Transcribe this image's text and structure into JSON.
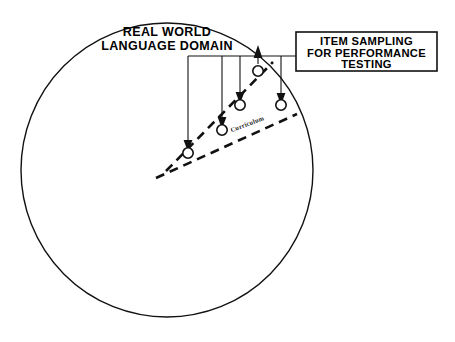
{
  "figure": {
    "background_color": "#ffffff",
    "line_color": "#111111"
  },
  "domain": {
    "name": "real-world-language-domain",
    "label_line1": "REAL WORLD",
    "label_line2": "LANGUAGE DOMAIN",
    "shape": "circle",
    "center": {
      "x": 167,
      "y": 170
    },
    "radius": 146
  },
  "callout_box": {
    "name": "item-sampling-box",
    "label_line1": "ITEM SAMPLING",
    "label_line2": "FOR PERFORMANCE",
    "label_line3": "TESTING",
    "x": 296,
    "y": 32,
    "width": 141,
    "height": 39
  },
  "curriculum": {
    "label": "Curriculum",
    "x": 248,
    "y": 126,
    "rotation_deg": -21
  },
  "wedge": {
    "name": "curriculum-wedge",
    "apex": {
      "x": 166,
      "y": 171
    },
    "upper_end": {
      "x": 273,
      "y": 62
    },
    "lower_end": {
      "x": 297,
      "y": 114
    },
    "style": "dashed"
  },
  "connector": {
    "name": "box-connector-line",
    "horizontal_y": 56,
    "from_x": 296,
    "to_x": 188
  },
  "items": [
    {
      "id": "item-1",
      "circle": {
        "x": 188,
        "y": 152
      },
      "r": 5.2,
      "drop_from_y": 56,
      "arrow_dir": "down",
      "arrow_tip_y": 145
    },
    {
      "id": "item-2",
      "circle": {
        "x": 222,
        "y": 129
      },
      "r": 5.2,
      "drop_from_y": 56,
      "arrow_dir": "down",
      "arrow_tip_y": 122
    },
    {
      "id": "item-3",
      "circle": {
        "x": 240,
        "y": 104
      },
      "r": 5.2,
      "drop_from_y": 56,
      "arrow_dir": "down",
      "arrow_tip_y": 97
    },
    {
      "id": "item-4",
      "circle": {
        "x": 258,
        "y": 71
      },
      "r": 5.2,
      "drop_from_y": 56,
      "arrow_dir": "up",
      "arrow_tip_y": 48
    },
    {
      "id": "item-5",
      "circle": {
        "x": 281,
        "y": 105
      },
      "r": 5.2,
      "drop_from_y": 56,
      "arrow_dir": "down",
      "arrow_tip_y": 98
    }
  ]
}
